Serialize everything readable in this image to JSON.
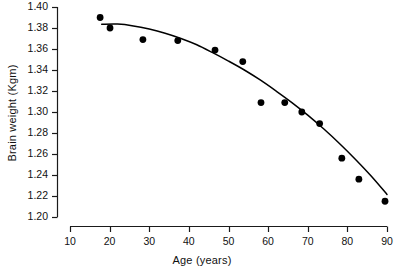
{
  "chart_data": {
    "type": "scatter",
    "title": "",
    "xlabel": "Age (years)",
    "ylabel": "Brain weight (Kgm)",
    "xlim": [
      10,
      90
    ],
    "ylim": [
      1.2,
      1.4
    ],
    "grid": false,
    "legend": null,
    "xticks": [
      "10",
      "20",
      "30",
      "40",
      "50",
      "60",
      "70",
      "80",
      "90"
    ],
    "xtick_values": [
      10,
      20,
      30,
      40,
      50,
      60,
      70,
      80,
      90
    ],
    "yticks": [
      "1.40",
      "1.38",
      "1.36",
      "1.34",
      "1.32",
      "1.30",
      "1.28",
      "1.26",
      "1.24",
      "1.22",
      "1.20"
    ],
    "ytick_values": [
      1.4,
      1.38,
      1.36,
      1.34,
      1.32,
      1.3,
      1.28,
      1.26,
      1.24,
      1.22,
      1.2
    ],
    "series": [
      {
        "name": "Observed brain weight",
        "type": "scatter",
        "marker": "filled-circle",
        "color": "#000000",
        "x": [
          17.6,
          20.1,
          28.4,
          37.2,
          46.6,
          53.6,
          58.2,
          64.2,
          68.5,
          73.0,
          78.6,
          82.9,
          89.5
        ],
        "y": [
          1.39,
          1.38,
          1.369,
          1.368,
          1.359,
          1.348,
          1.309,
          1.309,
          1.3,
          1.289,
          1.256,
          1.236,
          1.215
        ]
      },
      {
        "name": "Fitted curve",
        "type": "line",
        "color": "#000000",
        "x": [
          18.0,
          22.0,
          26.0,
          30.0,
          34.0,
          38.0,
          42.0,
          46.0,
          50.0,
          54.0,
          58.0,
          62.0,
          66.0,
          70.0,
          74.0,
          78.0,
          82.0,
          86.0,
          90.0
        ],
        "y": [
          1.3835,
          1.3837,
          1.382,
          1.379,
          1.375,
          1.37,
          1.364,
          1.3565,
          1.3485,
          1.34,
          1.3305,
          1.32,
          1.309,
          1.297,
          1.284,
          1.27,
          1.255,
          1.239,
          1.2215
        ]
      }
    ]
  },
  "axes": {
    "x_axis_name": "age-axis",
    "y_axis_name": "brain-weight-axis"
  }
}
